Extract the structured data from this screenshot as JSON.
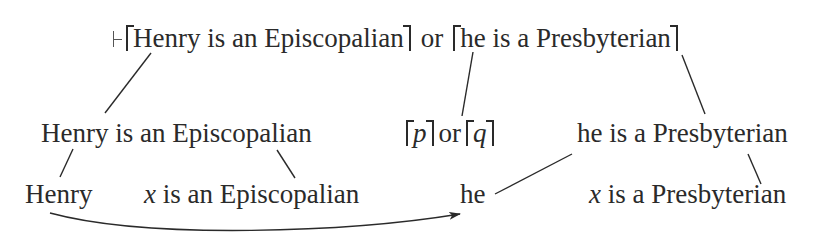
{
  "diagram": {
    "type": "logical-form parse tree with anaphora",
    "root": {
      "turnstile_symbol": "⊢",
      "left_quote_text": "Henry is an Episcopalian",
      "connective": "or",
      "right_quote_text": "he is a Presbyterian"
    },
    "level2": {
      "left_sentence": "Henry is an Episcopalian",
      "schema_p": "p",
      "schema_or": "or",
      "schema_q": "q",
      "right_sentence": "he is a Presbyterian"
    },
    "level3": {
      "name": "Henry",
      "left_predicate_var": "x",
      "left_predicate_rest": "is an Episcopalian",
      "pronoun": "he",
      "right_predicate_var": "x",
      "right_predicate_rest": "is a Presbyterian"
    },
    "edges": [
      {
        "from": "root.left_quote",
        "to": "level2.left_sentence"
      },
      {
        "from": "root.connective",
        "to": "level2.schema"
      },
      {
        "from": "root.right_quote",
        "to": "level2.right_sentence"
      },
      {
        "from": "level2.left_sentence",
        "to": "level3.name"
      },
      {
        "from": "level2.left_sentence",
        "to": "level3.left_predicate"
      },
      {
        "from": "level2.right_sentence",
        "to": "level3.pronoun"
      },
      {
        "from": "level2.right_sentence",
        "to": "level3.right_predicate"
      }
    ],
    "arrow": {
      "from": "level3.name",
      "to": "level3.pronoun",
      "meaning": "anaphoric link"
    },
    "colors": {
      "text": "#2a2a2a",
      "lines": "#2a2a2a",
      "background": "#ffffff"
    }
  }
}
